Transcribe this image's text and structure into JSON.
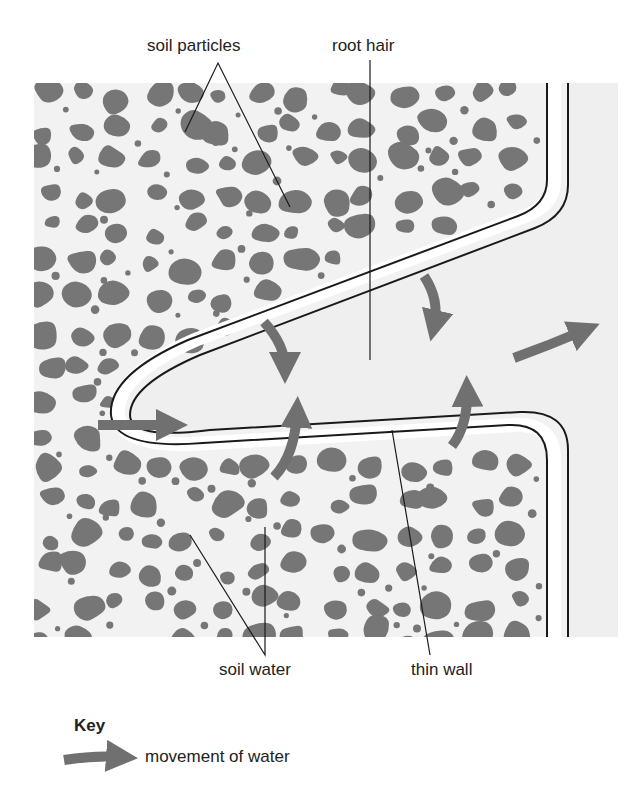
{
  "diagram": {
    "colors": {
      "background_panel": "#f2f2f2",
      "soil_particle": "#767676",
      "arrow": "#707070",
      "wall_line": "#1a1a1a",
      "wall_band": "#ffffff",
      "root_interior": "#efefef",
      "text": "#222222"
    },
    "labels": {
      "soil_particles": "soil particles",
      "root_hair": "root hair",
      "soil_water": "soil water",
      "thin_wall": "thin wall"
    },
    "key": {
      "title": "Key",
      "items": [
        {
          "icon": "arrow-icon",
          "label": "movement of water"
        }
      ]
    },
    "arrows": [
      {
        "name": "arrow-into-tip",
        "from": "soil",
        "to": "root hair tip"
      },
      {
        "name": "arrow-upper-left-in",
        "from": "soil (above)",
        "to": "root hair"
      },
      {
        "name": "arrow-lower-left-in",
        "from": "soil (below)",
        "to": "root hair"
      },
      {
        "name": "arrow-upper-right-in",
        "from": "soil (above)",
        "to": "root hair"
      },
      {
        "name": "arrow-lower-right-in",
        "from": "soil (below)",
        "to": "root hair"
      },
      {
        "name": "arrow-into-root",
        "from": "root hair",
        "to": "root"
      }
    ]
  }
}
